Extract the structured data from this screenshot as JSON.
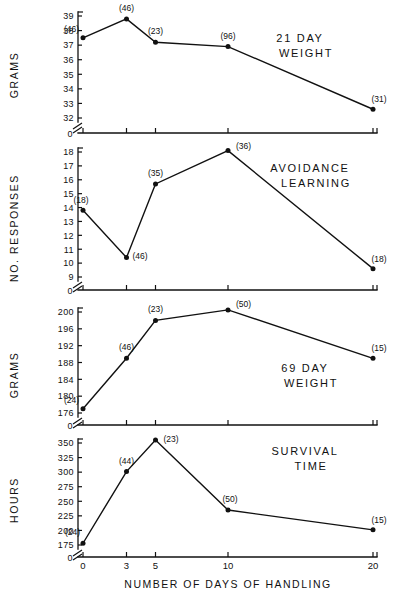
{
  "figure": {
    "xaxis_caption": "NUMBER  OF  DAYS  OF  HANDLING",
    "x_tick_labels": [
      "0",
      "3",
      "5",
      "10",
      "20"
    ]
  },
  "chart_data": [
    {
      "type": "line",
      "title": "21  DAY\nWEIGHT",
      "title_line1": "21   DAY",
      "title_line2": "WEIGHT",
      "xlabel": "NUMBER  OF  DAYS  OF  HANDLING",
      "ylabel": "GRAMS",
      "x": [
        0,
        3,
        5,
        10,
        20
      ],
      "values": [
        37.5,
        38.8,
        37.2,
        36.9,
        32.6
      ],
      "point_labels": [
        "(46)",
        "(46)",
        "(23)",
        "(96)",
        "(31)"
      ],
      "yticks": [
        32,
        33,
        34,
        35,
        36,
        37,
        38,
        39
      ],
      "ytick_labels": [
        "32",
        "33",
        "34",
        "35",
        "36",
        "37",
        "38",
        "39"
      ],
      "ylim": [
        32,
        39
      ],
      "axis_break": true,
      "zero_label": "0",
      "grid": false
    },
    {
      "type": "line",
      "title_line1": "AVOIDANCE",
      "title_line2": "LEARNING",
      "xlabel": "NUMBER  OF  DAYS  OF  HANDLING",
      "ylabel": "NO.  RESPONSES",
      "x": [
        0,
        3,
        5,
        10,
        20
      ],
      "values": [
        13.8,
        10.4,
        15.7,
        18.1,
        9.6
      ],
      "point_labels": [
        "(18)",
        "(46)",
        "(35)",
        "(36)",
        "(18)"
      ],
      "yticks": [
        9,
        10,
        11,
        12,
        13,
        14,
        15,
        16,
        17,
        18
      ],
      "ytick_labels": [
        "9",
        "10",
        "11",
        "12",
        "13",
        "14",
        "15",
        "16",
        "17",
        "18"
      ],
      "ylim": [
        9,
        18
      ],
      "axis_break": true,
      "zero_label": "0",
      "grid": false
    },
    {
      "type": "line",
      "title_line1": "69   DAY",
      "title_line2": "WEIGHT",
      "xlabel": "NUMBER  OF  DAYS  OF  HANDLING",
      "ylabel": "GRAMS",
      "x": [
        0,
        3,
        5,
        10,
        20
      ],
      "values": [
        177,
        189,
        198,
        200.5,
        189
      ],
      "point_labels": [
        "(24)",
        "(46)",
        "(23)",
        "(50)",
        "(15)"
      ],
      "yticks": [
        176,
        180,
        184,
        188,
        192,
        196,
        200
      ],
      "ytick_labels": [
        "176",
        "180",
        "184",
        "188",
        "192",
        "196",
        "200"
      ],
      "ylim": [
        176,
        200
      ],
      "axis_break": true,
      "zero_label": "0",
      "grid": false
    },
    {
      "type": "line",
      "title_line1": "SURVIVAL",
      "title_line2": "TIME",
      "xlabel": "NUMBER  OF  DAYS  OF  HANDLING",
      "ylabel": "HOURS",
      "x": [
        0,
        3,
        5,
        10,
        20
      ],
      "values": [
        178,
        301,
        355,
        235,
        201
      ],
      "point_labels": [
        "(24)",
        "(44)",
        "(23)",
        "(50)",
        "(15)"
      ],
      "yticks": [
        175,
        200,
        225,
        250,
        275,
        300,
        325,
        350
      ],
      "ytick_labels": [
        "175",
        "200",
        "225",
        "250",
        "275",
        "300",
        "325",
        "350"
      ],
      "ylim": [
        175,
        350
      ],
      "axis_break": true,
      "zero_label": "0",
      "grid": false
    }
  ]
}
